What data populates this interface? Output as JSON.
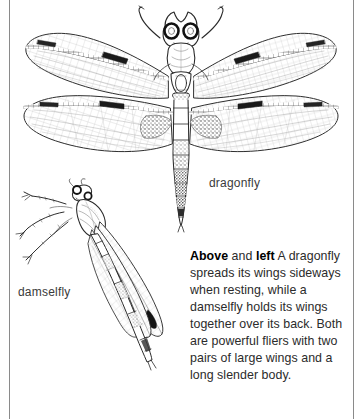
{
  "page": {
    "kind": "illustrated-book-page",
    "background_color": "#ffffff",
    "ink_color": "#2b2b2b",
    "rule_color": "#8a8a8a"
  },
  "figures": [
    {
      "id": "dragonfly",
      "name": "dragonfly-illustration",
      "label": "dragonfly",
      "description": "Line drawing of a dragonfly seen from above with two pairs of long wings spread out sideways, large compound eyes, and a long segmented abdomen.",
      "wing_pairs": 2,
      "abdomen_segments": 8,
      "pterostigma_visible": true
    },
    {
      "id": "damselfly",
      "name": "damselfly-illustration",
      "label": "damselfly",
      "description": "Line drawing of a damselfly at rest, body angled diagonally, legs gripping, with its wings held together over its back and a long slender abdomen.",
      "wing_pairs": 2,
      "abdomen_segments": 9,
      "pterostigma_visible": true
    }
  ],
  "labels": {
    "dragonfly": "dragonfly",
    "damselfly": "damselfly"
  },
  "caption": {
    "lead_bold_1": "Above",
    "between": " and ",
    "lead_bold_2": "left",
    "body": " A dragonfly spreads its wings sideways when resting, while a damselfly holds its wings together over its back. Both are powerful fliers with two pairs of large wings and a long slender body."
  }
}
